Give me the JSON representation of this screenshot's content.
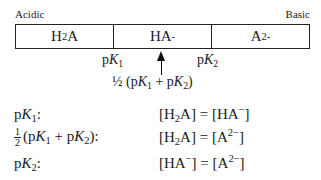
{
  "labels": {
    "left": "Acidic",
    "right": "Basic"
  },
  "regions": [
    {
      "species": "H2A",
      "base": "H",
      "sub": "2",
      "rest": "A",
      "sup": ""
    },
    {
      "species": "HA-",
      "base": "HA",
      "sub": "",
      "rest": "",
      "sup": "-"
    },
    {
      "species": "A2-",
      "base": "A",
      "sub": "",
      "rest": "",
      "sup": "2-"
    }
  ],
  "boundaries": [
    {
      "p": "p",
      "K": "K",
      "sub": "1"
    },
    {
      "p": "p",
      "K": "K",
      "sub": "2"
    }
  ],
  "midpoint": {
    "prefix": "½ (p",
    "K1": "K",
    "sub1": "1",
    "mid": " + p",
    "K2": "K",
    "sub2": "2",
    "suffix": ")"
  },
  "conditions": [
    {
      "condition": "pK1:",
      "equation": "[H2A] = [HA−]"
    },
    {
      "condition": "½ (pK1 + pK2):",
      "equation": "[H2A] = [A2−]"
    },
    {
      "condition": "pK2:",
      "equation": "[HA−] = [A2−]"
    }
  ],
  "glyphs": {
    "half_num": "1",
    "half_den": "2",
    "colon": ":",
    "eq": " = ",
    "lb": "[",
    "rb": "]",
    "minus": "−",
    "two_minus": "2−",
    "p": "p",
    "K": "K",
    "H": "H",
    "A": "A",
    "HA": "HA",
    "plus": " + ",
    "lp": "(",
    "rp": ")",
    "one": "1",
    "two": "2"
  }
}
